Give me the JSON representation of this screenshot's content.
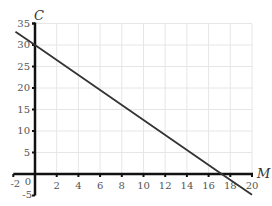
{
  "chart_data": {
    "type": "line",
    "title": "",
    "xlabel": "M",
    "ylabel": "C",
    "xlim": [
      -2,
      20
    ],
    "ylim": [
      -5,
      35
    ],
    "grid": true,
    "x_ticks": [
      2,
      4,
      6,
      8,
      10,
      12,
      14,
      16,
      18,
      20
    ],
    "x_tick_labels": [
      "-2",
      "2",
      "4",
      "6",
      "8",
      "10",
      "12",
      "14",
      "16",
      "18",
      "20"
    ],
    "y_ticks": [
      5,
      10,
      15,
      20,
      25,
      30,
      35
    ],
    "y_tick_labels": [
      "-5",
      "0",
      "5",
      "10",
      "15",
      "20",
      "25",
      "30",
      "35"
    ],
    "series": [
      {
        "name": "C vs M",
        "x": [
          -1.8,
          0,
          17.2,
          20
        ],
        "y": [
          33.1,
          30,
          0,
          -4.8
        ],
        "color": "#333333"
      }
    ],
    "annotations": [],
    "legend": "none"
  },
  "colors": {
    "axis": "#111111",
    "grid": "#e6e6e6",
    "line": "#333333",
    "text": "#555555"
  }
}
